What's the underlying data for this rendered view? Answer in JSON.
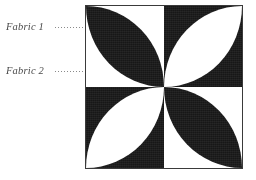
{
  "diagram": {
    "annotations": [
      {
        "id": "fabric-1",
        "label": "Fabric 1",
        "points_to": "dark-fabric",
        "leader_style": "dotted"
      },
      {
        "id": "fabric-2",
        "label": "Fabric 2",
        "points_to": "light-fabric",
        "leader_style": "dotted"
      }
    ],
    "colors": {
      "dark_fabric": "#171717",
      "light_fabric": "#ffffff",
      "outline": "#3a3a3a",
      "label_text": "#4a4a4a",
      "leader_line": "#8a8a8a",
      "page_background": "#ffffff"
    },
    "block": {
      "grid": "2x2",
      "quadrants": [
        {
          "position": "top-left",
          "background": "light",
          "petal": "dark"
        },
        {
          "position": "top-right",
          "background": "dark",
          "petal": "light"
        },
        {
          "position": "bottom-left",
          "background": "dark",
          "petal": "light"
        },
        {
          "position": "bottom-right",
          "background": "light",
          "petal": "dark"
        }
      ],
      "petal_shape": "two-arc lens (vesica) spanning each quadrant diagonally, tips meeting at block centre"
    }
  }
}
